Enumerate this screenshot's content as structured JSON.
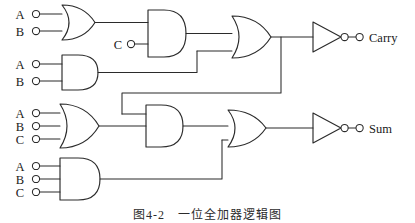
{
  "figure": {
    "caption": "图4-2　一位全加器逻辑图",
    "background": "#ffffff",
    "ink_color": "#2b2b2b"
  },
  "inputs": {
    "row1": [
      {
        "label": "A",
        "x": 20,
        "y": 14
      },
      {
        "label": "B",
        "x": 20,
        "y": 31
      }
    ],
    "row2": [
      {
        "label": "A",
        "x": 20,
        "y": 64
      },
      {
        "label": "B",
        "x": 20,
        "y": 81
      }
    ],
    "row3": [
      {
        "label": "A",
        "x": 20,
        "y": 113
      },
      {
        "label": "B",
        "x": 20,
        "y": 126
      },
      {
        "label": "C",
        "x": 20,
        "y": 139
      }
    ],
    "row4": [
      {
        "label": "A",
        "x": 20,
        "y": 166
      },
      {
        "label": "B",
        "x": 20,
        "y": 179
      },
      {
        "label": "C",
        "x": 20,
        "y": 192
      }
    ],
    "carry_in": {
      "label": "C",
      "x": 118,
      "y": 44
    }
  },
  "gates": [
    {
      "name": "or-gate-ab-top",
      "type": "OR",
      "inputs": [
        "A",
        "B"
      ],
      "row": 1
    },
    {
      "name": "and-gate-c-top",
      "type": "AND",
      "inputs": [
        "OR(A,B)",
        "C"
      ],
      "row": 1
    },
    {
      "name": "and-gate-ab",
      "type": "AND",
      "inputs": [
        "A",
        "B"
      ],
      "row": 2
    },
    {
      "name": "or-gate-carry",
      "type": "OR",
      "inputs": [
        "AND(OR(A,B),C)",
        "AND(A,B)"
      ],
      "row": 1
    },
    {
      "name": "not-gate-carry",
      "type": "NOT",
      "inputs": [
        "OR-carry"
      ],
      "row": 1
    },
    {
      "name": "or-gate-abc",
      "type": "OR",
      "inputs": [
        "A",
        "B",
        "C"
      ],
      "row": 3
    },
    {
      "name": "and-gate-mid",
      "type": "AND",
      "inputs": [
        "OR(A,B,C)",
        "carry-feedback"
      ],
      "row": 3
    },
    {
      "name": "and-gate-abc",
      "type": "AND",
      "inputs": [
        "A",
        "B",
        "C"
      ],
      "row": 4
    },
    {
      "name": "or-gate-sum",
      "type": "OR",
      "inputs": [
        "AND-mid",
        "AND(A,B,C)"
      ],
      "row": 3
    },
    {
      "name": "not-gate-sum",
      "type": "NOT",
      "inputs": [
        "OR-sum"
      ],
      "row": 3
    }
  ],
  "outputs": [
    {
      "label": "Carry",
      "x": 360,
      "y": 42
    },
    {
      "label": "Sum",
      "x": 360,
      "y": 131
    }
  ]
}
